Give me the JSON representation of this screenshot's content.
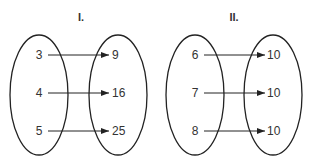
{
  "diagrams": [
    {
      "title": "I.",
      "domain": [
        "3",
        "4",
        "5"
      ],
      "range": [
        "9",
        "16",
        "25"
      ],
      "mappings": [
        [
          "3",
          "9"
        ],
        [
          "4",
          "16"
        ],
        [
          "5",
          "25"
        ]
      ]
    },
    {
      "title": "II.",
      "domain": [
        "6",
        "7",
        "8"
      ],
      "range": [
        "10",
        "10",
        "10"
      ],
      "mappings": [
        [
          "6",
          "10"
        ],
        [
          "7",
          "10"
        ],
        [
          "8",
          "10"
        ]
      ]
    }
  ],
  "colors": {
    "stroke": "#222222",
    "text": "#333333"
  }
}
